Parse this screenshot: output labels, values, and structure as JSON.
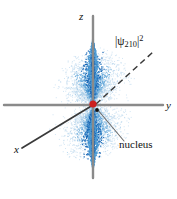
{
  "figure": {
    "background_color": "#ffffff",
    "width": 177,
    "height": 199
  },
  "axes": {
    "origin": {
      "x": 93,
      "y": 105
    },
    "y_axis": {
      "label": "y",
      "color": "#8a8a8a",
      "x1": 4,
      "y1": 105,
      "x2": 163,
      "y2": 105
    },
    "z_axis": {
      "label": "z",
      "color": "#8a8a8a",
      "x1": 93,
      "y1": 16,
      "x2": 93,
      "y2": 178
    },
    "x_axis": {
      "label": "x",
      "color": "#3a3a3a",
      "x1": 22,
      "y1": 148,
      "x2": 93,
      "y2": 105
    }
  },
  "annotations": {
    "psi": {
      "text": "|ψ210|2",
      "bar_left": "|",
      "psi_symbol": "ψ",
      "subscript": "210",
      "bar_right": "|",
      "superscript": "2",
      "leader": {
        "x1": 96,
        "y1": 104,
        "x2": 153,
        "y2": 52,
        "style": "dashed",
        "color": "#3a3a3a"
      }
    },
    "nucleus": {
      "label": "nucleus",
      "leader": {
        "x1": 97,
        "y1": 109,
        "x2": 124,
        "y2": 141,
        "style": "solid",
        "color": "#6e6e6e"
      },
      "marker_red": {
        "cx": 93,
        "cy": 104,
        "r": 3.6,
        "color": "#cc1f1f"
      },
      "marker_black": {
        "cx": 97,
        "cy": 110,
        "r": 1.9,
        "color": "#111111"
      }
    }
  },
  "orbital": {
    "type": "2p_z dumbbell probability cloud",
    "stipple_color_outer": "#9ec8e8",
    "stipple_color_mid": "#4a9ad4",
    "stipple_color_core": "#1565b5",
    "lobes": [
      {
        "name": "upper-lobe",
        "cx": 93,
        "cy": 66,
        "rx": 29,
        "ry": 38
      },
      {
        "name": "lower-lobe",
        "cx": 93,
        "cy": 142,
        "rx": 29,
        "ry": 38
      }
    ]
  }
}
